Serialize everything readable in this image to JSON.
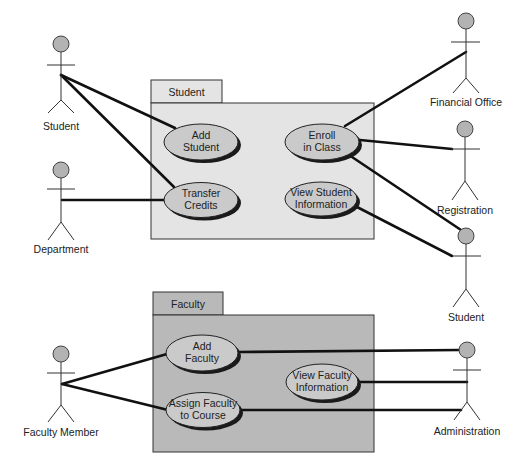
{
  "diagram": {
    "type": "UML use case diagram",
    "colors": {
      "student_package_fill": "#e4e4e4",
      "faculty_package_fill": "#b9b9b9",
      "tab_fill_student": "#e4e4e4",
      "tab_fill_faculty": "#b9b9b9",
      "usecase_fill": "#cacaca",
      "usecase_shadow": "#1a1a1a",
      "actor_head_fill": "#b3b3b3",
      "line": "#111111"
    },
    "packages": [
      {
        "id": "pkg-student",
        "label": "Student"
      },
      {
        "id": "pkg-faculty",
        "label": "Faculty"
      }
    ],
    "use_cases": [
      {
        "id": "uc-add-student",
        "package": "Student",
        "line1": "Add",
        "line2": "Student"
      },
      {
        "id": "uc-transfer-credits",
        "package": "Student",
        "line1": "Transfer",
        "line2": "Credits"
      },
      {
        "id": "uc-enroll",
        "package": "Student",
        "line1": "Enroll",
        "line2": "in Class"
      },
      {
        "id": "uc-view-student-info",
        "package": "Student",
        "line1": "View Student",
        "line2": "Information"
      },
      {
        "id": "uc-add-faculty",
        "package": "Faculty",
        "line1": "Add",
        "line2": "Faculty"
      },
      {
        "id": "uc-assign-faculty",
        "package": "Faculty",
        "line1": "Assign Faculty",
        "line2": "to Course"
      },
      {
        "id": "uc-view-faculty-info",
        "package": "Faculty",
        "line1": "View Faculty",
        "line2": "Information"
      }
    ],
    "actors": [
      {
        "id": "actor-student-left",
        "label": "Student"
      },
      {
        "id": "actor-department",
        "label": "Department"
      },
      {
        "id": "actor-financial-office",
        "label": "Financial Office"
      },
      {
        "id": "actor-registration",
        "label": "Registration"
      },
      {
        "id": "actor-student-right",
        "label": "Student"
      },
      {
        "id": "actor-faculty-member",
        "label": "Faculty Member"
      },
      {
        "id": "actor-administration",
        "label": "Administration"
      }
    ],
    "associations": [
      {
        "from": "Student (left)",
        "to": "Add Student"
      },
      {
        "from": "Student (left)",
        "to": "Transfer Credits"
      },
      {
        "from": "Department",
        "to": "Transfer Credits"
      },
      {
        "from": "Enroll in Class",
        "to": "Financial Office"
      },
      {
        "from": "Enroll in Class",
        "to": "Registration"
      },
      {
        "from": "Enroll in Class",
        "to": "Student (right)"
      },
      {
        "from": "View Student Information",
        "to": "Student (right)"
      },
      {
        "from": "Faculty Member",
        "to": "Add Faculty"
      },
      {
        "from": "Faculty Member",
        "to": "Assign Faculty to Course"
      },
      {
        "from": "Add Faculty",
        "to": "Administration"
      },
      {
        "from": "View Faculty Information",
        "to": "Administration"
      },
      {
        "from": "Assign Faculty to Course",
        "to": "Administration"
      }
    ]
  }
}
